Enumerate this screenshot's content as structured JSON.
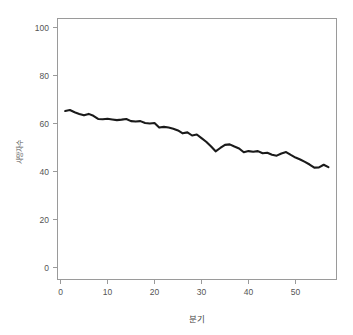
{
  "chart_data": {
    "type": "line",
    "title": "",
    "subtitle": "",
    "xlabel": "분기",
    "ylabel": "사망자수",
    "xlim": [
      0,
      58
    ],
    "ylim": [
      0,
      104
    ],
    "grid": false,
    "legend": false,
    "legend_position": "none",
    "x_ticks": [
      0,
      10,
      20,
      30,
      40,
      50
    ],
    "y_ticks": [
      0,
      20,
      40,
      60,
      80,
      100
    ],
    "x_tick_labels": [
      "0",
      "10",
      "20",
      "30",
      "40",
      "50"
    ],
    "y_tick_labels": [
      "0",
      "20",
      "40",
      "60",
      "80",
      "100"
    ],
    "line_color": "#1a1a1a",
    "series": [
      {
        "name": "series-1",
        "x": [
          1,
          2,
          3,
          4,
          5,
          6,
          7,
          8,
          9,
          10,
          11,
          12,
          13,
          14,
          15,
          16,
          17,
          18,
          19,
          20,
          21,
          22,
          23,
          24,
          25,
          26,
          27,
          28,
          29,
          30,
          31,
          32,
          33,
          34,
          35,
          36,
          37,
          38,
          39,
          40,
          41,
          42,
          43,
          44,
          45,
          46,
          47,
          48,
          49,
          50,
          51,
          52,
          53,
          54,
          55,
          56,
          57
        ],
        "values": [
          65.2,
          65.6,
          64.7,
          64.0,
          63.4,
          64.0,
          63.2,
          61.9,
          61.8,
          62.0,
          61.7,
          61.4,
          61.6,
          61.9,
          61.0,
          60.8,
          61.0,
          60.2,
          60.0,
          60.2,
          58.3,
          58.6,
          58.3,
          57.8,
          57.1,
          55.9,
          56.3,
          55.0,
          55.4,
          53.9,
          52.4,
          50.5,
          48.4,
          49.8,
          51.1,
          51.3,
          50.4,
          49.6,
          48.0,
          48.5,
          48.2,
          48.5,
          47.6,
          47.8,
          47.0,
          46.6,
          47.5,
          48.1,
          46.9,
          45.8,
          45.0,
          44.0,
          42.9,
          41.6,
          41.7,
          42.8,
          41.8
        ]
      }
    ]
  },
  "axes": {
    "x_title": "분기",
    "y_title": "사망자수"
  }
}
